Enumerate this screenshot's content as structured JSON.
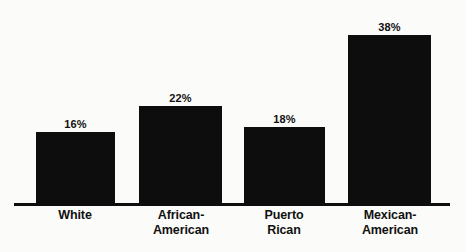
{
  "chart_data": {
    "type": "bar",
    "title": "",
    "subtitle": "",
    "xlabel": "",
    "ylabel": "",
    "ylim": [
      0,
      40
    ],
    "grid": false,
    "legend": null,
    "orientation": "vertical",
    "categories": [
      "White",
      "African-American",
      "Puerto Rican",
      "Mexican-American"
    ],
    "category_lines": [
      [
        "White"
      ],
      [
        "African-",
        "American"
      ],
      [
        "Puerto",
        "Rican"
      ],
      [
        "Mexican-",
        "American"
      ]
    ],
    "values": [
      16,
      22,
      18,
      38
    ],
    "value_labels": [
      "16%",
      "22%",
      "18%",
      "38%"
    ],
    "bar_color": "#0d0d0d",
    "background_color": "#fbfbf9",
    "axis_color": "#0d0d0d",
    "text_color": "#111111",
    "bars": [
      {
        "category": "White",
        "value": 16,
        "value_label": "16%",
        "left_px": 36,
        "width_px": 79,
        "height_px": 74
      },
      {
        "category": "African-American",
        "value": 22,
        "value_label": "22%",
        "left_px": 139,
        "width_px": 83,
        "height_px": 100
      },
      {
        "category": "Puerto Rican",
        "value": 18,
        "value_label": "18%",
        "left_px": 244,
        "width_px": 81,
        "height_px": 79
      },
      {
        "category": "Mexican-American",
        "value": 38,
        "value_label": "38%",
        "left_px": 348,
        "width_px": 83,
        "height_px": 171
      }
    ],
    "category_label_boxes": [
      {
        "left_px": 20,
        "width_px": 110
      },
      {
        "left_px": 125,
        "width_px": 112
      },
      {
        "left_px": 230,
        "width_px": 108
      },
      {
        "left_px": 332,
        "width_px": 116
      }
    ]
  }
}
